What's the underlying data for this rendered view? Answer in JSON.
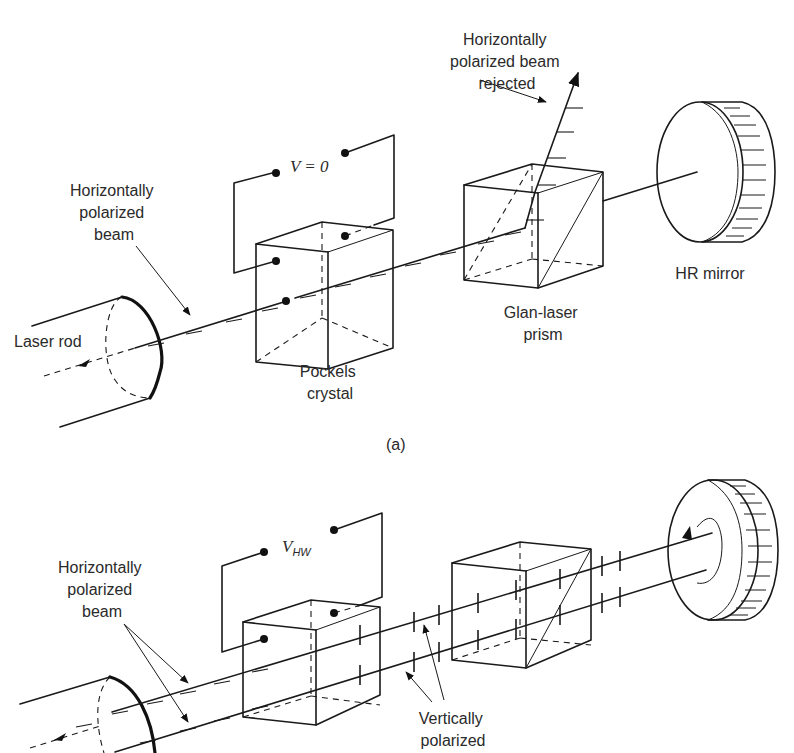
{
  "figure": {
    "panel_a": {
      "label": "(a)",
      "labels": {
        "rejected_beam": [
          "Horizontally",
          "polarized beam",
          "rejected"
        ],
        "horizontal_beam": [
          "Horizontally",
          "polarized",
          "beam"
        ],
        "voltage": "V = 0",
        "laser_rod": "Laser rod",
        "pockels_crystal": [
          "Pockels",
          "crystal"
        ],
        "glan_prism": [
          "Glan-laser",
          "prism"
        ],
        "hr_mirror": "HR mirror"
      }
    },
    "panel_b": {
      "labels": {
        "voltage_main": "V",
        "voltage_sub": "HW",
        "horizontal_beam": [
          "Horizontally",
          "polarized",
          "beam"
        ],
        "vertical_beam": [
          "Vertically",
          "polarized"
        ]
      }
    }
  }
}
